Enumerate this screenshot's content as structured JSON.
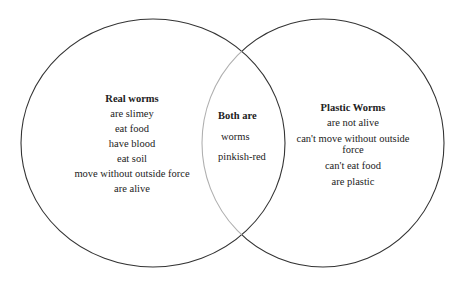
{
  "diagram": {
    "type": "venn",
    "stroke_color": "#333333",
    "overlap_stroke_color": "#b0b0b0",
    "left_set": {
      "title": "Real worms",
      "items": [
        "are slimey",
        "eat food",
        "have blood",
        "eat soil",
        "move without outside force",
        "are alive"
      ]
    },
    "intersection": {
      "title": "Both are",
      "items": [
        "worms",
        "pinkish-red"
      ]
    },
    "right_set": {
      "title": "Plastic Worms",
      "items": [
        "are not alive",
        "can't move without outside force",
        "can't eat food",
        "are plastic"
      ]
    }
  }
}
